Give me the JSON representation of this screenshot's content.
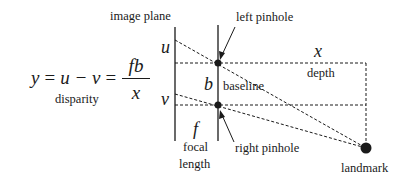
{
  "diagram": {
    "equation": {
      "lhs": "y",
      "eq1": "=",
      "mid": "u − v",
      "eq2": "=",
      "numerator": "fb",
      "denominator": "x",
      "caption": "disparity"
    },
    "labels": {
      "image_plane": "image plane",
      "left_pinhole": "left pinhole",
      "right_pinhole": "right pinhole",
      "u": "u",
      "v": "v",
      "b": "b",
      "baseline": "baseline",
      "x": "x",
      "depth": "depth",
      "f": "f",
      "focal": "focal",
      "length": "length",
      "landmark": "landmark"
    },
    "colors": {
      "line": "#1a1a1a",
      "background": "#ffffff"
    }
  }
}
